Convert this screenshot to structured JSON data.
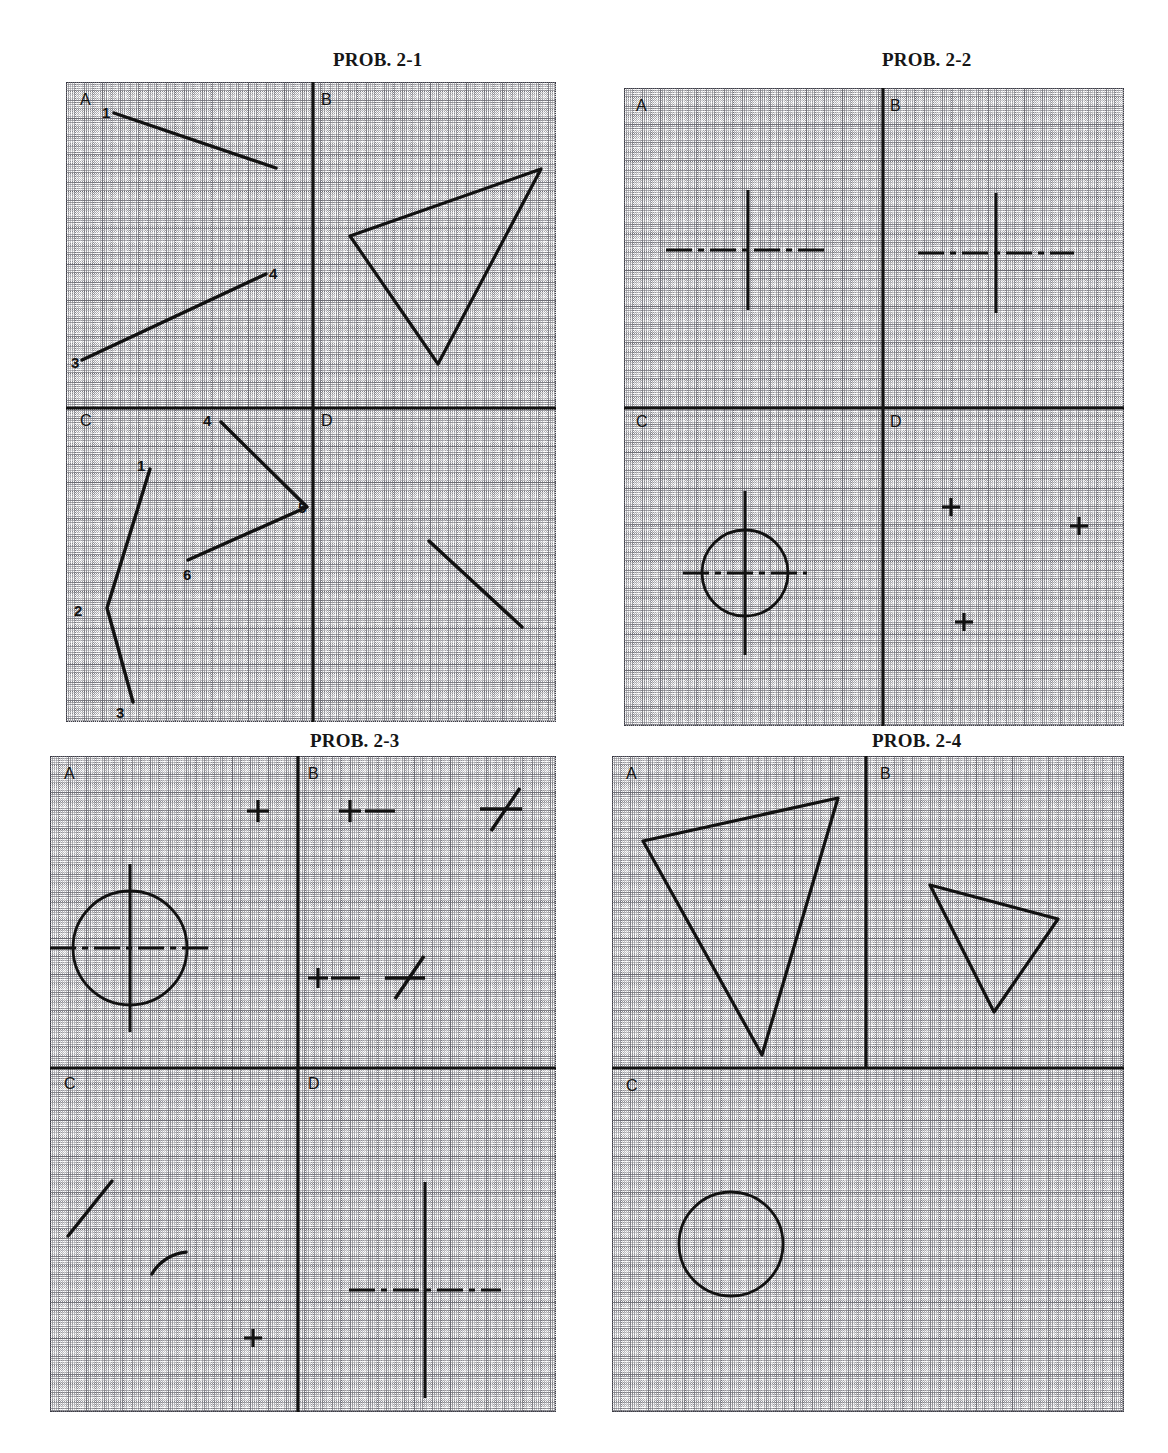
{
  "sheet": {
    "width": 1168,
    "height": 1453,
    "background": "#ffffff",
    "ink": "#111111",
    "grid_color": "#3a3a44"
  },
  "panels": [
    {
      "id": "prob-2-1",
      "title": "PROB. 2-1",
      "title_x": 333,
      "title_y": 49,
      "x": 66,
      "y": 82,
      "w": 490,
      "h": 640,
      "axis_x": 313,
      "axis_y": 408,
      "axis_v_top": 82,
      "axis_v_bottom": 722,
      "axis_h_left": 66,
      "axis_h_right": 556,
      "quadrant_labels": [
        {
          "name": "A",
          "text": "A",
          "x": 14,
          "y": 10
        },
        {
          "name": "B",
          "text": "B",
          "x": 255,
          "y": 10
        },
        {
          "name": "C",
          "text": "C",
          "x": 14,
          "y": 331
        },
        {
          "name": "D",
          "text": "D",
          "x": 255,
          "y": 331
        }
      ],
      "point_labels": [
        {
          "text": "1",
          "x": 36,
          "y": 23
        },
        {
          "text": "4",
          "x": 203,
          "y": 184
        },
        {
          "text": "3",
          "x": 5,
          "y": 273
        },
        {
          "text": "4",
          "x": 137,
          "y": 331
        },
        {
          "text": "1",
          "x": 71,
          "y": 376
        },
        {
          "text": "5",
          "x": 232,
          "y": 418
        },
        {
          "text": "6",
          "x": 117,
          "y": 485
        },
        {
          "text": "2",
          "x": 8,
          "y": 521
        },
        {
          "text": "3",
          "x": 50,
          "y": 623
        }
      ],
      "shapes": [
        {
          "type": "polyline",
          "name": "line-1-2",
          "points": "48,31 210,86"
        },
        {
          "type": "polygon",
          "name": "triangle-b",
          "points": "284,154 475,87 372,282"
        },
        {
          "type": "polyline",
          "name": "line-3-4",
          "points": "16,278 200,192"
        },
        {
          "type": "polyline",
          "name": "polyline-4-5-6",
          "points": "155,340 241,425 122,478"
        },
        {
          "type": "polyline",
          "name": "polyline-1-2-3",
          "points": "84,387 41,526 67,620"
        },
        {
          "type": "polyline",
          "name": "line-d",
          "points": "363,459 456,545"
        }
      ]
    },
    {
      "id": "prob-2-2",
      "title": "PROB. 2-2",
      "title_x": 882,
      "title_y": 49,
      "x": 624,
      "y": 88,
      "w": 500,
      "h": 638,
      "axis_x": 883,
      "axis_y": 408,
      "axis_v_top": 88,
      "axis_v_bottom": 726,
      "axis_h_left": 624,
      "axis_h_right": 1124,
      "quadrant_labels": [
        {
          "name": "A",
          "text": "A",
          "x": 12,
          "y": 10
        },
        {
          "name": "B",
          "text": "B",
          "x": 266,
          "y": 10
        },
        {
          "name": "C",
          "text": "C",
          "x": 12,
          "y": 326
        },
        {
          "name": "D",
          "text": "D",
          "x": 266,
          "y": 326
        }
      ],
      "point_labels": [],
      "shapes": [
        {
          "type": "centermark",
          "name": "center-mark-a",
          "cx": 124,
          "cy": 162,
          "vh": 60,
          "hw": 82
        },
        {
          "type": "centermark",
          "name": "center-mark-b",
          "cx": 372,
          "cy": 165,
          "vh": 60,
          "hw": 78
        },
        {
          "type": "centermark",
          "name": "center-mark-c",
          "cx": 121,
          "cy": 165,
          "vh": 82,
          "hw": 62,
          "quad": "C"
        },
        {
          "type": "circle",
          "name": "circle-c",
          "cx": 121,
          "cy": 165,
          "r": 43,
          "quad": "C"
        },
        {
          "type": "plus",
          "name": "plus-d-1",
          "cx": 68,
          "cy": 99,
          "s": 9,
          "quad": "D"
        },
        {
          "type": "plus",
          "name": "plus-d-2",
          "cx": 196,
          "cy": 118,
          "s": 9,
          "quad": "D"
        },
        {
          "type": "plus",
          "name": "plus-d-3",
          "cx": 81,
          "cy": 214,
          "s": 9,
          "quad": "D"
        }
      ]
    },
    {
      "id": "prob-2-3",
      "title": "PROB. 2-3",
      "title_x": 310,
      "title_y": 730,
      "x": 50,
      "y": 756,
      "w": 506,
      "h": 656,
      "axis_x": 298,
      "axis_y": 1068,
      "axis_v_top": 756,
      "axis_v_bottom": 1412,
      "axis_h_left": 50,
      "axis_h_right": 556,
      "quadrant_labels": [
        {
          "name": "A",
          "text": "A",
          "x": 14,
          "y": 10
        },
        {
          "name": "B",
          "text": "B",
          "x": 258,
          "y": 10
        },
        {
          "name": "C",
          "text": "C",
          "x": 14,
          "y": 320
        },
        {
          "name": "D",
          "text": "D",
          "x": 258,
          "y": 320
        }
      ],
      "point_labels": [],
      "shapes": [
        {
          "type": "plus",
          "name": "plus-a-1",
          "cx": 208,
          "cy": 55,
          "s": 11
        },
        {
          "type": "plus",
          "name": "plus-b-1",
          "cx": 300,
          "cy": 55,
          "s": 11
        },
        {
          "type": "dash",
          "name": "dash-b-1",
          "x1": 315,
          "y1": 55,
          "x2": 345,
          "y2": 55
        },
        {
          "type": "crossmark",
          "name": "slant-cross-b-1",
          "hx1": 430,
          "hy1": 53,
          "hx2": 472,
          "hy2": 53,
          "dx1": 441,
          "dy1": 75,
          "dx2": 470,
          "dy2": 32
        },
        {
          "type": "centermark",
          "name": "center-mark-a",
          "cx": 80,
          "cy": 192,
          "vh": 84,
          "hw": 80
        },
        {
          "type": "circle",
          "name": "circle-a",
          "cx": 80,
          "cy": 192,
          "r": 57
        },
        {
          "type": "plus",
          "name": "plus-b-2",
          "cx": 268,
          "cy": 222,
          "s": 10
        },
        {
          "type": "dash",
          "name": "dash-b-2",
          "x1": 281,
          "y1": 222,
          "x2": 310,
          "y2": 222
        },
        {
          "type": "crossmark",
          "name": "slant-cross-b-2",
          "hx1": 335,
          "hy1": 222,
          "hx2": 375,
          "hy2": 222,
          "dx1": 345,
          "dy1": 243,
          "dx2": 374,
          "dy2": 200
        },
        {
          "type": "polyline",
          "name": "diag-line-c",
          "points": "18,480 62,425"
        },
        {
          "type": "arc",
          "name": "arc-c",
          "cx": 140,
          "cy": 540,
          "r": 44,
          "a1": 210,
          "a2": 265
        },
        {
          "type": "plus",
          "name": "plus-c-1",
          "cx": 203,
          "cy": 582,
          "s": 9
        },
        {
          "type": "centermark",
          "name": "center-mark-d",
          "cx": 127,
          "cy": 222,
          "vh": 108,
          "hw": 76,
          "quad": "D"
        }
      ]
    },
    {
      "id": "prob-2-4",
      "title": "PROB. 2-4",
      "title_x": 872,
      "title_y": 730,
      "x": 612,
      "y": 756,
      "w": 512,
      "h": 656,
      "axis_x": 866,
      "axis_y": 1068,
      "axis_v_top": 756,
      "axis_v_bottom": 1068,
      "axis_h_left": 612,
      "axis_h_right": 1124,
      "quadrant_labels": [
        {
          "name": "A",
          "text": "A",
          "x": 14,
          "y": 10
        },
        {
          "name": "B",
          "text": "B",
          "x": 268,
          "y": 10
        },
        {
          "name": "C",
          "text": "C",
          "x": 14,
          "y": 322
        }
      ],
      "point_labels": [],
      "shapes": [
        {
          "type": "polygon",
          "name": "triangle-a",
          "points": "31,85 226,42 150,299"
        },
        {
          "type": "polygon",
          "name": "triangle-b",
          "points": "318,129 446,163 382,256"
        },
        {
          "type": "circle",
          "name": "circle-c",
          "cx": 119,
          "cy": 488,
          "r": 52
        }
      ]
    }
  ]
}
